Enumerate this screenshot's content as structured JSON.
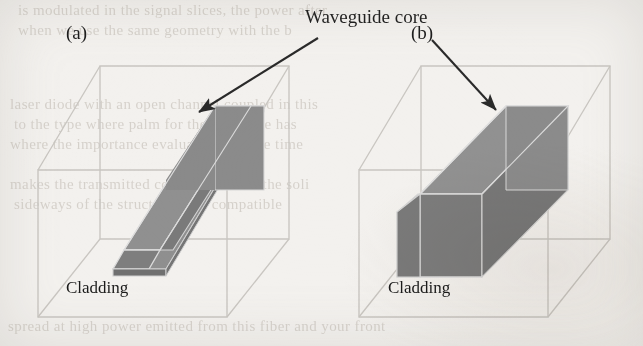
{
  "figure": {
    "caption_label_a": "(a)",
    "caption_label_b": "(b)",
    "annotation": "Waveguide core",
    "cladding_label_a": "Cladding",
    "cladding_label_b": "Cladding",
    "colors": {
      "paper": "#f3f1ee",
      "core_fill": "#8a8a8a",
      "core_fill_dark": "#7b7b7b",
      "core_fill_light": "#9a9a9a",
      "core_edge": "#d8d8d8",
      "wire": "#c9c6c1",
      "arrow": "#2a2a2a",
      "text": "#1b1b1b",
      "ghost_text": "#b9b2a9"
    }
  },
  "panels": [
    {
      "id": "a",
      "label": "(a)",
      "cladding_label": "Cladding",
      "waveguide_type": "ridge waveguide",
      "description": "Wireframe cladding cube containing a shallow slab with a raised rib running diagonally"
    },
    {
      "id": "b",
      "label": "(b)",
      "cladding_label": "Cladding",
      "waveguide_type": "strip waveguide",
      "description": "Wireframe cladding cube containing a tall rectangular strip running diagonally"
    }
  ],
  "annotation": {
    "text": "Waveguide core",
    "arrow_a": {
      "from_x": 318,
      "from_y": 38,
      "to_x": 196,
      "to_y": 114
    },
    "arrow_b": {
      "from_x": 432,
      "from_y": 40,
      "to_x": 499,
      "to_y": 113
    }
  },
  "ghost_text_lines": [
    {
      "text": "is modulated in the signal slices, the power after",
      "x": 18,
      "y": 2,
      "size": 15
    },
    {
      "text": "when we use the same geometry with the b",
      "x": 18,
      "y": 22,
      "size": 15
    },
    {
      "text": "laser diode with an open channel coupled in this",
      "x": 10,
      "y": 96,
      "size": 15
    },
    {
      "text": "to the type where palm for the over time has",
      "x": 14,
      "y": 116,
      "size": 15
    },
    {
      "text": "where the importance evaluation is some time",
      "x": 10,
      "y": 136,
      "size": 15
    },
    {
      "text": "makes the transmitted concentration of the soli",
      "x": 10,
      "y": 176,
      "size": 15
    },
    {
      "text": "sideways of the structures in a compatible",
      "x": 14,
      "y": 196,
      "size": 15
    },
    {
      "text": "spread at high power emitted from this fiber and your front",
      "x": 8,
      "y": 318,
      "size": 15
    }
  ]
}
